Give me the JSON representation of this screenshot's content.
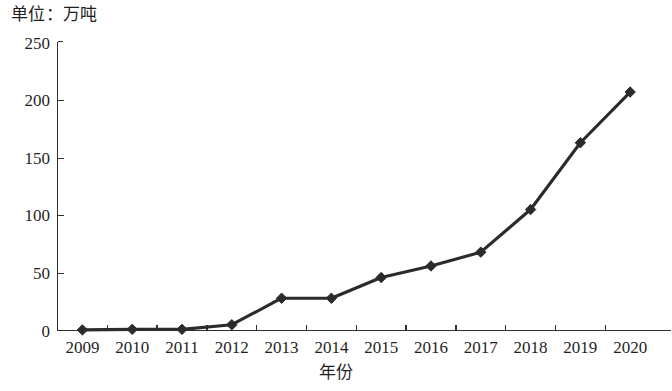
{
  "chart_data": {
    "type": "line",
    "title": "",
    "unit_note": "单位：万吨",
    "xlabel": "年份",
    "ylabel": "",
    "categories": [
      "2009",
      "2010",
      "2011",
      "2012",
      "2013",
      "2014",
      "2015",
      "2016",
      "2017",
      "2018",
      "2019",
      "2020"
    ],
    "values": [
      0.5,
      1,
      1,
      5,
      28,
      28,
      46,
      56,
      68,
      105,
      163,
      207
    ],
    "series": [
      {
        "name": "产量",
        "values": [
          0.5,
          1,
          1,
          5,
          28,
          28,
          46,
          56,
          68,
          105,
          163,
          207
        ]
      }
    ],
    "ylim": [
      0,
      250
    ],
    "yticks": [
      "0",
      "50",
      "100",
      "150",
      "200",
      "250"
    ],
    "ytick_values": [
      0,
      50,
      100,
      150,
      200,
      250
    ],
    "grid": false,
    "legend": "none",
    "marker": "diamond",
    "line_color": "#2b2b2b",
    "axis_color": "#303030",
    "background_color": "#ffffff"
  }
}
